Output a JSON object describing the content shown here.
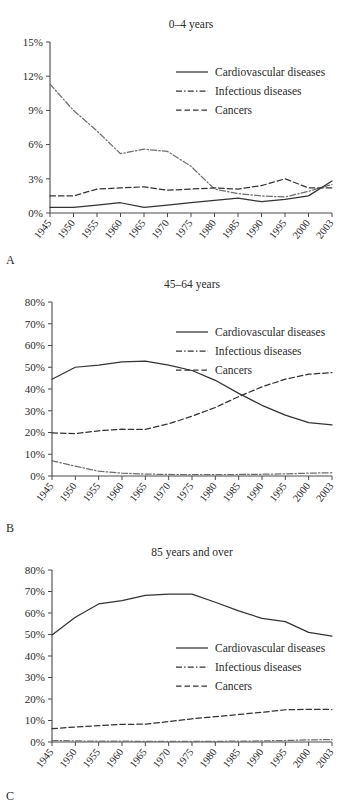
{
  "figure": {
    "panels": [
      {
        "letter": "A",
        "title": "0–4 years",
        "yaxis": {
          "min": 0,
          "max": 15,
          "step": 3,
          "ticks": [
            "0%",
            "3%",
            "6%",
            "9%",
            "12%",
            "15%"
          ]
        }
      },
      {
        "letter": "B",
        "title": "45–64 years",
        "yaxis": {
          "min": 0,
          "max": 80,
          "step": 10,
          "ticks": [
            "0%",
            "10%",
            "20%",
            "30%",
            "40%",
            "50%",
            "60%",
            "70%",
            "80%"
          ]
        }
      },
      {
        "letter": "C",
        "title": "85 years and over",
        "yaxis": {
          "min": 0,
          "max": 80,
          "step": 10,
          "ticks": [
            "0%",
            "10%",
            "20%",
            "30%",
            "40%",
            "50%",
            "60%",
            "70%",
            "80%"
          ]
        }
      }
    ],
    "legend": [
      {
        "key": "cardiovascular",
        "label": "Cardiovascular diseases",
        "style": "solid"
      },
      {
        "key": "infectious",
        "label": "Infectious diseases",
        "style": "dash-dot"
      },
      {
        "key": "cancers",
        "label": "Cancers",
        "style": "dashed"
      }
    ],
    "colors": {
      "line": "#333333",
      "infectious_line": "#6e6e6e",
      "axis": "#4a4a4a",
      "text": "#2a2a2a",
      "background": "#ffffff"
    }
  },
  "chart_data": [
    {
      "id": "panel-a",
      "type": "line",
      "title": "0–4 years",
      "panel_letter": "A",
      "xlabel": "",
      "ylabel": "",
      "categories": [
        "1945",
        "1950",
        "1955",
        "1960",
        "1965",
        "1970",
        "1975",
        "1980",
        "1985",
        "1990",
        "1995",
        "2000",
        "2003"
      ],
      "xlim": [
        1945,
        2003
      ],
      "ylim": [
        0,
        15
      ],
      "ytick_values": [
        0,
        3,
        6,
        9,
        12,
        15
      ],
      "ytick_labels": [
        "0%",
        "3%",
        "6%",
        "9%",
        "12%",
        "15%"
      ],
      "grid": false,
      "legend_position": "upper-right",
      "series": [
        {
          "name": "Cardiovascular diseases",
          "style": "solid",
          "values": [
            0.5,
            0.5,
            0.7,
            0.9,
            0.5,
            0.7,
            0.9,
            1.1,
            1.3,
            1.0,
            1.2,
            1.5,
            2.8
          ]
        },
        {
          "name": "Infectious diseases",
          "style": "dash-dot",
          "values": [
            11.3,
            9.0,
            7.2,
            5.2,
            5.6,
            5.4,
            4.1,
            2.1,
            1.7,
            1.5,
            1.4,
            1.9,
            2.5
          ]
        },
        {
          "name": "Cancers",
          "style": "dashed",
          "values": [
            1.5,
            1.5,
            2.1,
            2.2,
            2.3,
            2.0,
            2.1,
            2.2,
            2.1,
            2.4,
            3.0,
            2.2,
            2.2
          ]
        }
      ]
    },
    {
      "id": "panel-b",
      "type": "line",
      "title": "45–64 years",
      "panel_letter": "B",
      "xlabel": "",
      "ylabel": "",
      "categories": [
        "1945",
        "1950",
        "1955",
        "1960",
        "1965",
        "1970",
        "1975",
        "1980",
        "1985",
        "1990",
        "1995",
        "2000",
        "2003"
      ],
      "xlim": [
        1945,
        2003
      ],
      "ylim": [
        0,
        80
      ],
      "ytick_values": [
        0,
        10,
        20,
        30,
        40,
        50,
        60,
        70,
        80
      ],
      "ytick_labels": [
        "0%",
        "10%",
        "20%",
        "30%",
        "40%",
        "50%",
        "60%",
        "70%",
        "80%"
      ],
      "grid": false,
      "legend_position": "upper-right",
      "series": [
        {
          "name": "Cardiovascular diseases",
          "style": "solid",
          "values": [
            44.5,
            50.0,
            51.0,
            52.5,
            52.8,
            51.0,
            48.5,
            44.0,
            38.0,
            32.5,
            28.0,
            24.5,
            23.5
          ]
        },
        {
          "name": "Infectious diseases",
          "style": "dash-dot",
          "values": [
            7.0,
            4.5,
            2.2,
            1.3,
            0.9,
            0.7,
            0.6,
            0.6,
            0.7,
            0.8,
            1.0,
            1.3,
            1.5
          ]
        },
        {
          "name": "Cancers",
          "style": "dashed",
          "values": [
            19.8,
            19.5,
            20.8,
            21.5,
            21.4,
            24.0,
            27.5,
            31.5,
            36.5,
            41.0,
            44.5,
            46.8,
            47.5
          ]
        }
      ]
    },
    {
      "id": "panel-c",
      "type": "line",
      "title": "85 years and over",
      "panel_letter": "C",
      "xlabel": "",
      "ylabel": "",
      "categories": [
        "1945",
        "1950",
        "1955",
        "1960",
        "1965",
        "1970",
        "1975",
        "1980",
        "1985",
        "1990",
        "1995",
        "2000",
        "2003"
      ],
      "xlim": [
        1945,
        2003
      ],
      "ylim": [
        0,
        80
      ],
      "ytick_values": [
        0,
        10,
        20,
        30,
        40,
        50,
        60,
        70,
        80
      ],
      "ytick_labels": [
        "0%",
        "10%",
        "20%",
        "30%",
        "40%",
        "50%",
        "60%",
        "70%",
        "80%"
      ],
      "grid": false,
      "legend_position": "middle-right",
      "series": [
        {
          "name": "Cardiovascular diseases",
          "style": "solid",
          "values": [
            49.8,
            58.0,
            64.2,
            65.8,
            68.2,
            68.8,
            68.8,
            65.0,
            61.0,
            57.5,
            56.0,
            51.0,
            49.3
          ]
        },
        {
          "name": "Infectious diseases",
          "style": "dash-dot",
          "values": [
            0.7,
            0.5,
            0.4,
            0.4,
            0.3,
            0.3,
            0.3,
            0.3,
            0.4,
            0.5,
            0.7,
            1.0,
            1.1
          ]
        },
        {
          "name": "Cancers",
          "style": "dashed",
          "values": [
            6.2,
            7.0,
            7.6,
            8.2,
            8.3,
            9.5,
            10.8,
            11.8,
            12.8,
            13.8,
            15.0,
            15.2,
            15.1
          ]
        }
      ]
    }
  ]
}
